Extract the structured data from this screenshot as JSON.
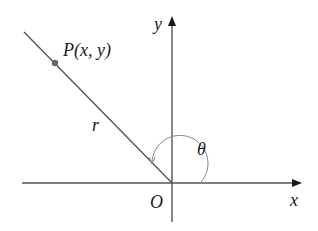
{
  "diagram": {
    "type": "polar-coordinates",
    "labels": {
      "point": "P(x, y)",
      "radius": "r",
      "angle": "θ",
      "origin": "O",
      "x_axis": "x",
      "y_axis": "y"
    },
    "colors": {
      "axis": "#555555",
      "ray": "#555555",
      "point": "#666666",
      "arc": "#888888",
      "text": "#1a1a1a"
    }
  }
}
